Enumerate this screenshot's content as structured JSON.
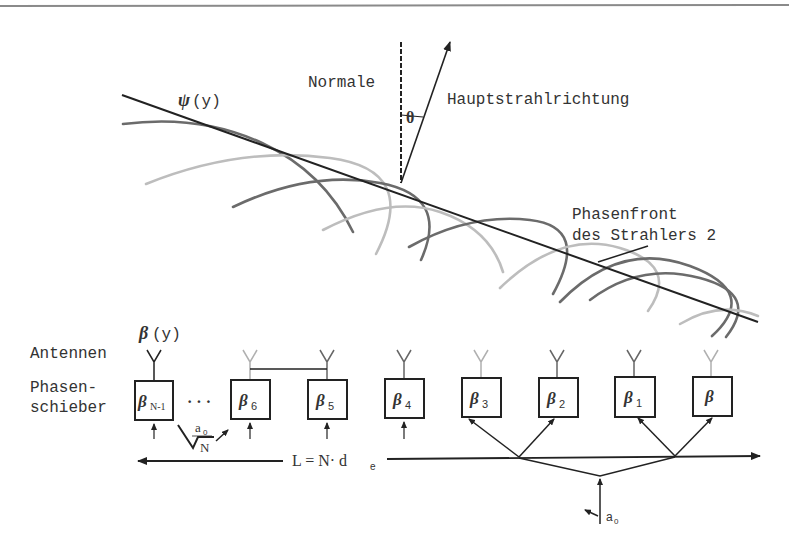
{
  "diagram": {
    "labels": {
      "normale": "Normale",
      "hauptstrahl": "Hauptstrahlrichtung",
      "theta": "θ",
      "psi": "ψ",
      "psi_arg": "(y)",
      "phasenfront_line1": "Phasenfront",
      "phasenfront_line2": "des Strahlers 2",
      "beta_y": "β",
      "beta_y_arg": "(y)",
      "antennen": "Antennen",
      "phasen_line1": "Phasen-",
      "phasen_line2": "schieber",
      "dots": "· · ·",
      "length_eq": "L = N· d",
      "length_sub": "e",
      "a0_top": "a",
      "a0_top_sub": "0",
      "sqrtN": "N",
      "a0_bottom": "a",
      "a0_bottom_sub": "0"
    },
    "phase_shifters": [
      {
        "symbol": "β",
        "sub": "N-1"
      },
      {
        "symbol": "β",
        "sub": "6"
      },
      {
        "symbol": "β",
        "sub": "5"
      },
      {
        "symbol": "β",
        "sub": "4"
      },
      {
        "symbol": "β",
        "sub": "3"
      },
      {
        "symbol": "β",
        "sub": "2"
      },
      {
        "symbol": "β",
        "sub": "1"
      },
      {
        "symbol": "β",
        "sub": ""
      }
    ],
    "colors": {
      "line": "#222222",
      "arc_dark": "#6b6b6b",
      "arc_light": "#bdbdbd",
      "antenna_light": "#b0b0b0",
      "border": "#8a8a8a"
    }
  }
}
